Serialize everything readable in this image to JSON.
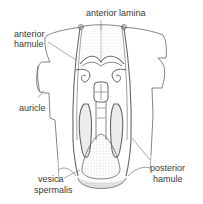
{
  "figure": {
    "colors": {
      "line": "#555555",
      "stipple": "#9a9a9a",
      "label": "#3a3a3a",
      "background": "#ffffff"
    }
  },
  "labels": {
    "anterior_lamina": "anterior lamina",
    "anterior_hamule_1": "anterior",
    "anterior_hamule_2": "hamule",
    "auricle": "auricle",
    "posterior_hamule_1": "posterior",
    "posterior_hamule_2": "hamule",
    "vesica_spermalis_1": "vesica",
    "vesica_spermalis_2": "spermalis"
  }
}
